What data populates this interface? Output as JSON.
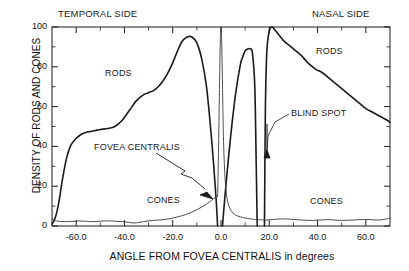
{
  "figure": {
    "background_color": "#ffffff",
    "line_color": "#1a1a1a"
  },
  "annotations": {
    "temporal_side": "TEMPORAL SIDE",
    "nasal_side": "NASAL SIDE",
    "rods_left": "RODS",
    "rods_right": "RODS",
    "cones_left": "CONES",
    "cones_right": "CONES",
    "fovea_centralis": "FOVEA CENTRALIS",
    "blind_spot": "BLIND SPOT"
  },
  "chart_data": {
    "type": "line",
    "title": "",
    "xlabel": "ANGLE FROM FOVEA CENTRALIS in degrees",
    "ylabel": "DENSITY OF RODS AND CONES",
    "xlim": [
      -70,
      70
    ],
    "ylim": [
      0,
      100
    ],
    "xticks": [
      -60,
      -40,
      -20,
      0,
      20,
      40,
      60
    ],
    "xtick_labels": [
      "-60.0",
      "-40.0",
      "-20.0",
      "0.0",
      "20.0",
      "40.0",
      "60.0"
    ],
    "yticks": [
      0,
      20,
      40,
      60,
      80,
      100
    ],
    "ytick_labels": [
      "0",
      "20",
      "40",
      "60",
      "80",
      "100"
    ],
    "minor_xticks": [
      -50,
      -30,
      -10,
      10,
      30,
      50
    ],
    "minor_yticks": [
      10,
      30,
      50,
      70,
      90
    ],
    "grid": false,
    "legend": "none",
    "blind_spot_range": [
      15.0,
      18.0
    ],
    "fovea_gap_range": [
      -1.4,
      0.6
    ],
    "series": [
      {
        "name": "RODS",
        "color": "#1a1a1a",
        "line_width": 1.6,
        "segments": [
          {
            "name": "rods-temporal",
            "x": [
              -70,
              -69,
              -68,
              -67,
              -66,
              -65,
              -64,
              -63,
              -62,
              -60,
              -58,
              -56,
              -54,
              -52,
              -50,
              -47,
              -44,
              -41,
              -38,
              -35,
              -32,
              -30,
              -28,
              -26,
              -24,
              -22,
              -20,
              -18,
              -16,
              -14,
              -12,
              -10,
              -8,
              -6,
              -4,
              -3,
              -2,
              -1.4
            ],
            "y": [
              1,
              3,
              7,
              13,
              21,
              28,
              34,
              38,
              41,
              44,
              46,
              47,
              47.5,
              48,
              48.5,
              49,
              50,
              53,
              58,
              63,
              66,
              67,
              68,
              70,
              73,
              77,
              82,
              88,
              93,
              95,
              95,
              92,
              84,
              70,
              45,
              30,
              13,
              0
            ]
          },
          {
            "name": "rods-fovea-to-blindspot",
            "x": [
              0.6,
              2,
              4,
              6,
              8,
              9,
              10,
              11,
              12,
              13,
              14,
              14.6,
              15.0
            ],
            "y": [
              0,
              20,
              45,
              66,
              81,
              85,
              88,
              89,
              89,
              87,
              70,
              30,
              0
            ]
          },
          {
            "name": "rods-nasal",
            "x": [
              18.0,
              18.4,
              19,
              20,
              21,
              22,
              24,
              26,
              28,
              30,
              33,
              36,
              39,
              42,
              45,
              48,
              51,
              54,
              57,
              60,
              63,
              66,
              69,
              70
            ],
            "y": [
              0,
              60,
              88,
              98,
              100,
              99,
              96,
              93,
              91,
              89,
              86,
              82,
              79,
              77,
              74,
              71,
              68,
              65,
              62,
              59,
              57,
              55,
              53,
              52
            ]
          }
        ]
      },
      {
        "name": "CONES",
        "color": "#3a3a3a",
        "line_width": 0.9,
        "segments": [
          {
            "name": "cones-temporal",
            "x": [
              -70,
              -68,
              -65,
              -62,
              -59,
              -56,
              -53,
              -50,
              -47,
              -44,
              -41,
              -38,
              -36,
              -34,
              -32,
              -30,
              -28,
              -26,
              -24,
              -22,
              -20,
              -18,
              -16,
              -14,
              -12,
              -10,
              -8,
              -6,
              -4,
              -3,
              -2,
              -1.4
            ],
            "y": [
              3.5,
              2.5,
              2.2,
              2.3,
              2.5,
              2.4,
              2.2,
              2.4,
              2.6,
              2.4,
              2.2,
              1.8,
              1.5,
              1.8,
              2.2,
              2.6,
              2.8,
              3.0,
              3.2,
              3.5,
              4.0,
              4.6,
              5.2,
              6.0,
              7.0,
              8.2,
              9.5,
              11.0,
              12.8,
              13.8,
              14.6,
              15.0
            ]
          },
          {
            "name": "cones-fovea-peak",
            "x": [
              -1.4,
              -1.0,
              -0.6,
              -0.3,
              -0.1,
              0,
              0.1,
              0.3,
              0.6
            ],
            "y": [
              15,
              40,
              72,
              92,
              99,
              100,
              99,
              92,
              72
            ]
          },
          {
            "name": "cones-nasal",
            "x": [
              0.6,
              1,
              1.5,
              2,
              2.5,
              3,
              4,
              5,
              6,
              7,
              8,
              9,
              10,
              12,
              14,
              15,
              18,
              20,
              23,
              26,
              29,
              32,
              35,
              38,
              41,
              44,
              47,
              50,
              53,
              56,
              59,
              62,
              65,
              68,
              70
            ],
            "y": [
              72,
              45,
              28,
              19,
              14,
              11,
              8,
              6.5,
              5.5,
              5.0,
              4.6,
              4.3,
              4.0,
              3.6,
              3.3,
              3.2,
              3.0,
              3.1,
              3.4,
              3.6,
              3.4,
              3.1,
              2.9,
              2.8,
              3.0,
              3.2,
              3.0,
              2.8,
              2.9,
              3.1,
              3.3,
              3.2,
              3.0,
              3.4,
              4.0
            ]
          }
        ]
      }
    ]
  }
}
